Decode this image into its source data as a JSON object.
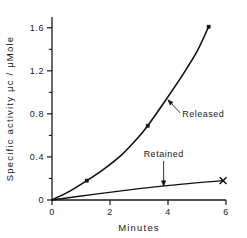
{
  "chart_data": {
    "type": "line",
    "title": "",
    "xlabel": "Minutes",
    "ylabel": "Specific activity μc / μMole",
    "xlim": [
      0,
      6
    ],
    "ylim": [
      0,
      1.7
    ],
    "xticks": [
      "0",
      "2",
      "4",
      "6"
    ],
    "xtick_values": [
      0,
      2,
      4,
      6
    ],
    "yticks": [
      "0",
      "0.4",
      "0.8",
      "1.2",
      "1.6"
    ],
    "ytick_values": [
      0,
      0.4,
      0.8,
      1.2,
      1.6
    ],
    "y_minor_ticks": [
      0.2,
      0.6,
      1.0,
      1.4
    ],
    "grid": false,
    "legend": "none",
    "series": [
      {
        "name": "Released",
        "marker": "filled-square",
        "x": [
          0,
          1.2,
          3.3,
          5.4
        ],
        "values": [
          0,
          0.18,
          0.69,
          1.61
        ],
        "curve_x": [
          0,
          0.6,
          1.2,
          1.8,
          2.4,
          3.0,
          3.3,
          3.9,
          4.5,
          5.0,
          5.4
        ],
        "curve_y": [
          0,
          0.08,
          0.18,
          0.29,
          0.42,
          0.59,
          0.69,
          0.92,
          1.16,
          1.38,
          1.61
        ]
      },
      {
        "name": "Retained",
        "marker": "x",
        "x": [
          0,
          5.9
        ],
        "values": [
          0,
          0.18
        ],
        "curve_x": [
          0,
          1.5,
          3.0,
          4.5,
          5.9
        ],
        "curve_y": [
          0,
          0.055,
          0.105,
          0.148,
          0.18
        ]
      }
    ],
    "annotations": [
      {
        "label": "Released",
        "at_x": 4.0,
        "at_y": 0.93,
        "text_x": 4.35,
        "text_y": 0.8
      },
      {
        "label": "Retained",
        "at_x": 3.85,
        "at_y": 0.13,
        "text_x": 3.85,
        "text_y": 0.4
      }
    ]
  },
  "colors": {
    "ink": "#111111",
    "background": "#ffffff"
  }
}
